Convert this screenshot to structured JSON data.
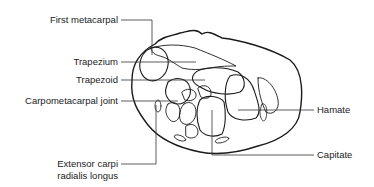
{
  "diagram": {
    "type": "anatomical cross-section (wrist, carpal bones)",
    "labels": {
      "first_metacarpal": "First metacarpal",
      "trapezium": "Trapezium",
      "trapezoid": "Trapezoid",
      "carpometacarpal_joint": "Carpometacarpal joint",
      "extensor_line1": "Extensor carpi",
      "extensor_line2": "radialis longus",
      "hamate": "Hamate",
      "capitate": "Capitate"
    },
    "colors": {
      "line": "#1a1a1a",
      "text": "#222222",
      "background": "#ffffff"
    }
  }
}
